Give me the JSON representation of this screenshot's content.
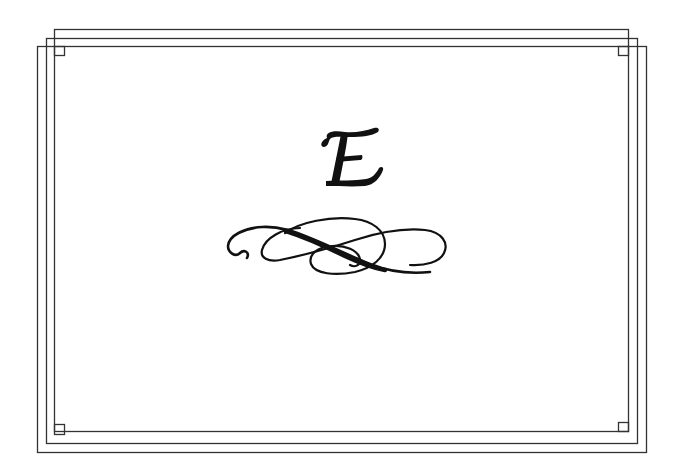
{
  "card": {
    "letter": "E",
    "letter_style": "calligraphic",
    "ornament": "flourish-divider",
    "border": "triple-interlocking-rectangles",
    "colors": {
      "background": "#ffffff",
      "ink": "#111111",
      "border_line": "#333333"
    }
  }
}
